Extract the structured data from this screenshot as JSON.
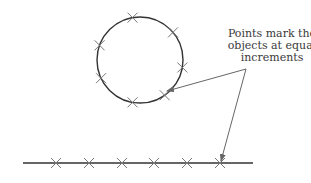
{
  "annotation": {
    "lines": [
      "Points mark the",
      "objects at equal",
      "increments"
    ]
  },
  "circle": {
    "center": [
      140,
      60
    ],
    "radius": 43,
    "marker_angles_deg": [
      -100,
      -40,
      10,
      55,
      100,
      155,
      200
    ]
  },
  "line": {
    "start": [
      23,
      163
    ],
    "end": [
      253,
      163
    ],
    "marker_x": [
      56,
      89,
      122,
      154,
      187,
      220
    ]
  },
  "colors": {
    "stroke": "#333333",
    "marker": "#777777",
    "arrow": "#666666",
    "text": "#3a3a3a"
  }
}
